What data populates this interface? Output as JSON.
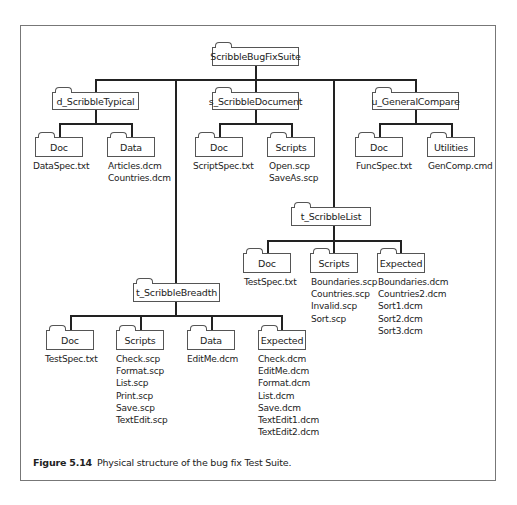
{
  "root": {
    "label": "ScribbleBugFixSuite"
  },
  "nodes": {
    "d_typical": {
      "label": "d_ScribbleTypical",
      "children": {
        "doc": {
          "label": "Doc",
          "files": [
            "DataSpec.txt"
          ]
        },
        "data": {
          "label": "Data",
          "files": [
            "Articles.dcm",
            "Countries.dcm"
          ]
        }
      }
    },
    "s_document": {
      "label": "s_ScribbleDocument",
      "children": {
        "doc": {
          "label": "Doc",
          "files": [
            "ScriptSpec.txt"
          ]
        },
        "scripts": {
          "label": "Scripts",
          "files": [
            "Open.scp",
            "SaveAs.scp"
          ]
        }
      }
    },
    "u_compare": {
      "label": "u_GeneralCompare",
      "children": {
        "doc": {
          "label": "Doc",
          "files": [
            "FuncSpec.txt"
          ]
        },
        "utilities": {
          "label": "Utilities",
          "files": [
            "GenComp.cmd"
          ]
        }
      }
    },
    "t_list": {
      "label": "t_ScribbleList",
      "children": {
        "doc": {
          "label": "Doc",
          "files": [
            "TestSpec.txt"
          ]
        },
        "scripts": {
          "label": "Scripts",
          "files": [
            "Boundaries.scp",
            "Countries.scp",
            "Invalid.scp",
            "Sort.scp"
          ]
        },
        "expected": {
          "label": "Expected",
          "files": [
            "Boundaries.dcm",
            "Countries2.dcm",
            "Sort1.dcm",
            "Sort2.dcm",
            "Sort3.dcm"
          ]
        }
      }
    },
    "t_breadth": {
      "label": "t_ScribbleBreadth",
      "children": {
        "doc": {
          "label": "Doc",
          "files": [
            "TestSpec.txt"
          ]
        },
        "scripts": {
          "label": "Scripts",
          "files": [
            "Check.scp",
            "Format.scp",
            "List.scp",
            "Print.scp",
            "Save.scp",
            "TextEdit.scp"
          ]
        },
        "data": {
          "label": "Data",
          "files": [
            "EditMe.dcm"
          ]
        },
        "expected": {
          "label": "Expected",
          "files": [
            "Check.dcm",
            "EditMe.dcm",
            "Format.dcm",
            "List.dcm",
            "Save.dcm",
            "TextEdit1.dcm",
            "TextEdit2.dcm"
          ]
        }
      }
    }
  },
  "caption": {
    "label": "Figure 5.14",
    "text": "Physical structure of the bug fix Test Suite."
  }
}
